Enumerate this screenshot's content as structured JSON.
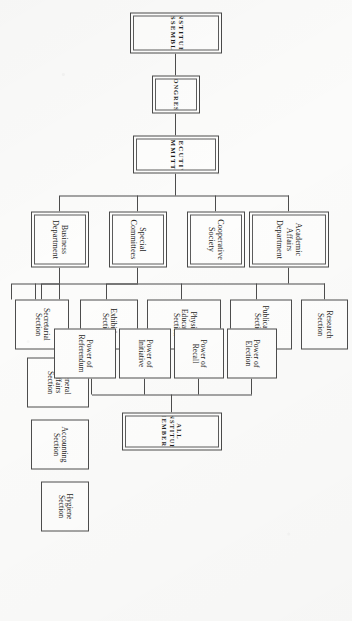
{
  "chart": {
    "type": "organization-tree",
    "orientation": "rotated-90-on-page",
    "root": "CONSTITUENT ASSEMBLY",
    "nodes": {
      "constituent_assembly": "CONSTITUENT ASSEMBLY",
      "congress": "CONGRESS",
      "executive_committee": "EXECUTIVE COMMITTEE",
      "business_department": "Business Department",
      "special_committees": "Special Committees",
      "cooperative_society": "Cooperative Society",
      "academic_affairs_department": "Academic Affairs Department",
      "hygiene_section": "Hygiene Section",
      "accounting_section": "Accounting Section",
      "general_affairs_section": "General Affairs Section",
      "secretarial_section": "Secretarial Section",
      "exhibition_section": "Exhibition Section",
      "physical_education_section": "Physical Education Section",
      "publications_section": "Publications Section",
      "research_section": "Research Section",
      "all_constituent_members": "ALL CONSTITUENT MEMBERS",
      "power_of_referendum": "Power of Referendum",
      "power_of_initiative": "Power of Initiative",
      "power_of_recall": "Power of Recall",
      "power_of_election": "Power of Election"
    },
    "edges": [
      [
        "constituent_assembly",
        "congress"
      ],
      [
        "congress",
        "executive_committee"
      ],
      [
        "executive_committee",
        "business_department"
      ],
      [
        "executive_committee",
        "special_committees"
      ],
      [
        "executive_committee",
        "cooperative_society"
      ],
      [
        "executive_committee",
        "academic_affairs_department"
      ],
      [
        "business_department",
        "hygiene_section"
      ],
      [
        "business_department",
        "accounting_section"
      ],
      [
        "business_department",
        "general_affairs_section"
      ],
      [
        "special_committees",
        "secretarial_section"
      ],
      [
        "academic_affairs_department",
        "exhibition_section"
      ],
      [
        "academic_affairs_department",
        "physical_education_section"
      ],
      [
        "academic_affairs_department",
        "publications_section"
      ],
      [
        "academic_affairs_department",
        "research_section"
      ],
      [
        "all_constituent_members",
        "power_of_referendum"
      ],
      [
        "all_constituent_members",
        "power_of_initiative"
      ],
      [
        "all_constituent_members",
        "power_of_recall"
      ],
      [
        "all_constituent_members",
        "power_of_election"
      ]
    ],
    "colors": {
      "paper": "#fbfbfa",
      "ink": "#1d1d1d",
      "rule": "#4d4d4d"
    }
  }
}
